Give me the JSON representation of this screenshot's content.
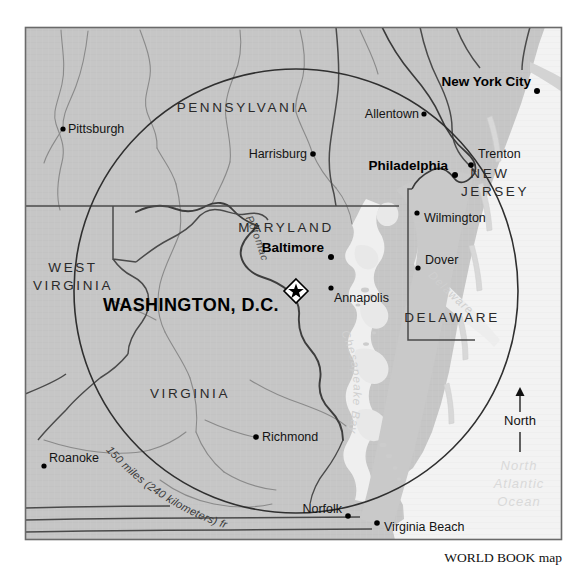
{
  "map": {
    "title": "150-mile radius around Washington, D.C.",
    "credit": "WORLD BOOK map",
    "frame": {
      "x": 25,
      "y": 27,
      "width": 537,
      "height": 513
    },
    "colors": {
      "land": "#c6c6c6",
      "land_light": "#d2d2d2",
      "ocean": "#f3f3f3",
      "bay_water": "#ececec",
      "border_line": "#5a5a5a",
      "state_line": "#3c3c3c",
      "radius_circle": "#2f2f2f",
      "frame_line": "#6a6a6a",
      "text": "#111111",
      "water_text": "#d9d9d9"
    },
    "states": [
      {
        "name": "PENNSYLVANIA",
        "x": 243,
        "y": 112
      },
      {
        "name": "MARYLAND",
        "x": 286,
        "y": 232
      },
      {
        "name": "WEST",
        "x": 73,
        "y": 272
      },
      {
        "name": "VIRGINIA",
        "x": 73,
        "y": 290
      },
      {
        "name": "VIRGINIA",
        "x": 190,
        "y": 398
      },
      {
        "name": "NEW",
        "x": 490,
        "y": 178
      },
      {
        "name": "JERSEY",
        "x": 495,
        "y": 196
      },
      {
        "name": "DELAWARE",
        "x": 452,
        "y": 322
      }
    ],
    "cities": [
      {
        "name": "Pittsburgh",
        "dot_x": 63,
        "dot_y": 129,
        "label_x": 68,
        "label_y": 133,
        "anchor": "start",
        "major": false
      },
      {
        "name": "Allentown",
        "dot_x": 424,
        "dot_y": 114,
        "label_x": 419,
        "label_y": 118,
        "anchor": "end",
        "major": false
      },
      {
        "name": "New York City",
        "dot_x": 537,
        "dot_y": 91,
        "label_x": 532,
        "label_y": 86,
        "anchor": "end",
        "major": true
      },
      {
        "name": "Trenton",
        "dot_x": 471,
        "dot_y": 165,
        "label_x": 478,
        "label_y": 157,
        "anchor": "start",
        "major": false
      },
      {
        "name": "Harrisburg",
        "dot_x": 313,
        "dot_y": 154,
        "label_x": 307,
        "label_y": 158,
        "anchor": "end",
        "major": false
      },
      {
        "name": "Philadelphia",
        "dot_x": 455,
        "dot_y": 175,
        "label_x": 449,
        "label_y": 170,
        "anchor": "end",
        "major": true
      },
      {
        "name": "Wilmington",
        "dot_x": 417,
        "dot_y": 213,
        "label_x": 423,
        "label_y": 222,
        "anchor": "start",
        "major": false
      },
      {
        "name": "Baltimore",
        "dot_x": 331,
        "dot_y": 257,
        "label_x": 325,
        "label_y": 252,
        "anchor": "end",
        "major": true
      },
      {
        "name": "Dover",
        "dot_x": 418,
        "dot_y": 268,
        "label_x": 424,
        "label_y": 263,
        "anchor": "start",
        "major": false
      },
      {
        "name": "Annapolis",
        "dot_x": 331,
        "dot_y": 288,
        "label_x": 336,
        "label_y": 301,
        "anchor": "start",
        "major": false
      },
      {
        "name": "Richmond",
        "dot_x": 256,
        "dot_y": 437,
        "label_x": 262,
        "label_y": 441,
        "anchor": "start",
        "major": false
      },
      {
        "name": "Roanoke",
        "dot_x": 44,
        "dot_y": 466,
        "label_x": 49,
        "label_y": 462,
        "anchor": "start",
        "major": false
      },
      {
        "name": "Norfolk",
        "dot_x": 348,
        "dot_y": 516,
        "label_x": 342,
        "label_y": 512,
        "anchor": "end",
        "major": false
      },
      {
        "name": "Virginia Beach",
        "dot_x": 377,
        "dot_y": 523,
        "label_x": 384,
        "label_y": 530,
        "anchor": "start",
        "major": false
      }
    ],
    "capital": {
      "name": "WASHINGTON, D.C.",
      "marker_x": 296,
      "marker_y": 291,
      "label_x": 289,
      "label_y": 305,
      "marker_type": "star-in-diamond"
    },
    "water_labels": [
      {
        "name": "North",
        "x": 519,
        "y": 470
      },
      {
        "name": "Atlantic",
        "x": 519,
        "y": 488
      },
      {
        "name": "Ocean",
        "x": 519,
        "y": 506
      }
    ],
    "bay_labels": [
      {
        "name": "Chesapeake Bay",
        "id": "chesapeake"
      },
      {
        "name": "Delaware Bay",
        "id": "delaware-bay"
      }
    ],
    "river_labels": [
      {
        "name": "Potomac R.",
        "id": "potomac"
      }
    ],
    "radius": {
      "label": "150 miles (240 kilometers) from Washington, D.C.",
      "miles": 150,
      "kilometers": 240,
      "center_x": 296,
      "center_y": 291,
      "radius_px": 222
    },
    "compass": {
      "label": "North",
      "arrow_x": 520,
      "arrow_top_y": 390,
      "arrow_bottom_y": 450,
      "label_y": 421
    }
  }
}
